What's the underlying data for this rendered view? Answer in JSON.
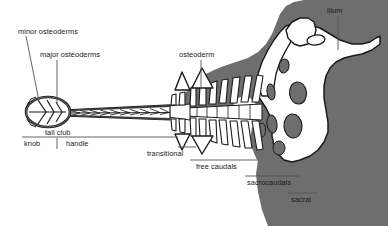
{
  "figure": {
    "kind": "anatomical-diagram",
    "background_color": "#ffffff",
    "bone_fill_color": "#ffffff",
    "body_silhouette_color": "#6e6e6e",
    "outline_color": "#1a1a1a",
    "text_color": "#1a1a1a"
  },
  "labels": {
    "minor_osteoderms": "minor osteoderms",
    "major_osteoderms": "major osteoderms",
    "osteoderm": "osteoderm",
    "ilium": "ilium",
    "tail_club": "tail club",
    "knob": "knob",
    "handle": "handle",
    "transitional": "transitional",
    "free_caudals": "free caudals",
    "sacrocaudals": "sacrocaudals",
    "sacral": "sacral"
  },
  "callouts": [
    {
      "id": "minor-osteoderms",
      "text": "minor osteoderms",
      "x": 18,
      "y": 27,
      "leader": "diagonal-down-right"
    },
    {
      "id": "major-osteoderms",
      "text": "major osteoderms",
      "x": 40,
      "y": 51,
      "leader": "vertical-down"
    },
    {
      "id": "osteoderm",
      "text": "osteoderm",
      "x": 180,
      "y": 51,
      "leader": "vertical-down"
    },
    {
      "id": "ilium",
      "text": "ilium",
      "x": 328,
      "y": 6,
      "leader": "vertical-down"
    }
  ],
  "brackets": [
    {
      "id": "tail-club",
      "text": "tail club",
      "x": 45,
      "y": 128,
      "rule_from": 22,
      "rule_to": 178,
      "rule_y": 137
    },
    {
      "id": "knob",
      "text": "knob",
      "x": 24,
      "y": 140,
      "divider_x": 58
    },
    {
      "id": "handle",
      "text": "handle",
      "x": 66,
      "y": 140
    },
    {
      "id": "transitional",
      "text": "transitional",
      "x": 147,
      "y": 150,
      "rule_from": 178,
      "rule_to": 196,
      "rule_y": 147
    },
    {
      "id": "free-caudals",
      "text": "free caudals",
      "x": 196,
      "y": 163,
      "rule_from": 190,
      "rule_to": 258,
      "rule_y": 160
    },
    {
      "id": "sacrocaudals",
      "text": "sacrocaudals",
      "x": 248,
      "y": 179,
      "rule_from": 245,
      "rule_to": 300,
      "rule_y": 176
    },
    {
      "id": "sacral",
      "text": "sacral",
      "x": 291,
      "y": 196,
      "rule_from": 288,
      "rule_to": 318,
      "rule_y": 193
    }
  ],
  "anatomy_parts": [
    {
      "name": "knob",
      "description": "ovoid terminal mass formed by fused major and minor osteoderms"
    },
    {
      "name": "handle",
      "description": "stiffened distal caudal vertebrae with elongate prezygapophyses"
    },
    {
      "name": "transitional vertebrae",
      "description": "vertebrae between handle and free caudals"
    },
    {
      "name": "free caudals",
      "description": "mobile caudal vertebrae with neural spines and chevrons"
    },
    {
      "name": "sacrocaudals",
      "description": "caudal vertebrae incorporated into the sacrum"
    },
    {
      "name": "sacral",
      "description": "sacral vertebrae fused to the pelvis"
    },
    {
      "name": "ilium",
      "description": "broad pelvic blade"
    },
    {
      "name": "osteoderm",
      "description": "dermal armour plate"
    }
  ]
}
